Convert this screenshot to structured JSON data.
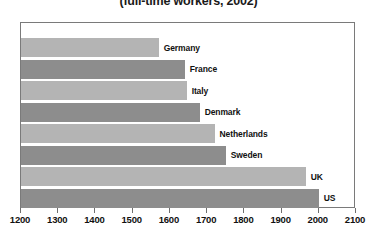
{
  "chart_data": {
    "type": "bar",
    "orientation": "horizontal",
    "title": "(full-time workers, 2002)",
    "xlabel": "",
    "ylabel": "",
    "xlim": [
      1200,
      2100
    ],
    "xticks": [
      1200,
      1300,
      1400,
      1500,
      1600,
      1700,
      1800,
      1900,
      2000,
      2100
    ],
    "grid": false,
    "legend": "none",
    "categories": [
      "Germany",
      "France",
      "Italy",
      "Denmark",
      "Netherlands",
      "Sweden",
      "UK",
      "US"
    ],
    "values": [
      1570,
      1640,
      1645,
      1680,
      1720,
      1750,
      1965,
      2000
    ],
    "colors": {
      "bar_light": "#b4b4b4",
      "bar_dark": "#8d8d8d",
      "frame": "#7a7a7a",
      "background": "#ffffff",
      "text": "#111111"
    },
    "bars": [
      {
        "label": "Germany",
        "value": 1570,
        "shade": "light"
      },
      {
        "label": "France",
        "value": 1640,
        "shade": "dark"
      },
      {
        "label": "Italy",
        "value": 1645,
        "shade": "light"
      },
      {
        "label": "Denmark",
        "value": 1680,
        "shade": "dark"
      },
      {
        "label": "Netherlands",
        "value": 1720,
        "shade": "light"
      },
      {
        "label": "Sweden",
        "value": 1750,
        "shade": "dark"
      },
      {
        "label": "UK",
        "value": 1965,
        "shade": "light"
      },
      {
        "label": "US",
        "value": 2000,
        "shade": "dark"
      }
    ]
  }
}
